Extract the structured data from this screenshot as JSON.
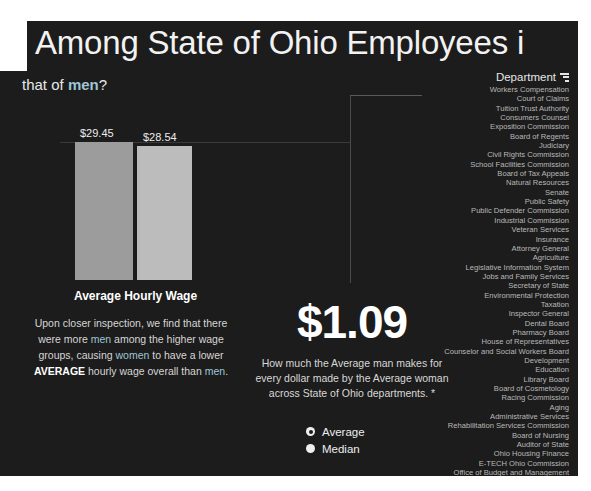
{
  "header": {
    "title": "Among State of Ohio Employees i",
    "subtitle_pre": "that of ",
    "subtitle_hl": "men",
    "subtitle_post": "?"
  },
  "chart_data": {
    "type": "bar",
    "title": "Average Hourly Wage",
    "categories": [
      "Men",
      "Women"
    ],
    "values": [
      29.45,
      28.54
    ],
    "value_labels": [
      "$29.45",
      "$28.54"
    ],
    "xlabel": "",
    "ylabel": "",
    "ylim": [
      0,
      31
    ],
    "grid": true,
    "legend": "none",
    "colors": [
      "#9c9c9c",
      "#bcbcbc"
    ]
  },
  "blurb": {
    "t1": "Upon closer inspection, we find that there were more ",
    "hl1": "men",
    "t2": " among the higher wage groups, causing ",
    "hl2": "women",
    "t3": " to have a lower ",
    "bold": "AVERAGE",
    "t4": " hourly wage overall than ",
    "hl3": "men",
    "t5": "."
  },
  "kpi": {
    "value": "$1.09",
    "caption": "How much the Average man makes for every dollar made by the Average woman across State of Ohio departments. *"
  },
  "measure_toggle": {
    "selected": "Average",
    "options": [
      {
        "label": "Average",
        "selected": true
      },
      {
        "label": "Median",
        "selected": false
      }
    ]
  },
  "department_panel": {
    "header": "Department",
    "sort_icon": "sort-descending-icon",
    "items": [
      "Workers Compensation",
      "Court of Claims",
      "Tuition Trust Authority",
      "Consumers Counsel",
      "Exposition Commission",
      "Board of Regents",
      "Judiciary",
      "Civil Rights Commission",
      "School Facilities Commission",
      "Board of Tax Appeals",
      "Natural Resources",
      "Senate",
      "Public Safety",
      "Public Defender Commission",
      "Industrial Commission",
      "Veteran Services",
      "Insurance",
      "Attorney General",
      "Agriculture",
      "Legislative Information System",
      "Jobs and Family Services",
      "Secretary of State",
      "Environmental Protection",
      "Taxation",
      "Inspector General",
      "Dental Board",
      "Pharmacy Board",
      "House of Representatives",
      "Counselor and Social Workers Board",
      "Development",
      "Education",
      "Library Board",
      "Board of Cosmetology",
      "Racing Commission",
      "Aging",
      "Administrative Services",
      "Rehabilitation Services Commission",
      "Board of Nursing",
      "Auditor of State",
      "Ohio Housing Finance",
      "E-TECH Ohio Commission",
      "Office of Budget and Management",
      "Medicaid",
      "Developmental Disabilities",
      "Ethics Commission",
      "Health"
    ]
  },
  "colors": {
    "panel_bg": "#1c1c1c",
    "page_bg": "#ffffff",
    "accent_highlight": "#9ec6d4",
    "bar_men": "#9c9c9c",
    "bar_women": "#bcbcbc",
    "text_primary": "#f2f2f2",
    "text_muted": "#b9b9b9"
  }
}
